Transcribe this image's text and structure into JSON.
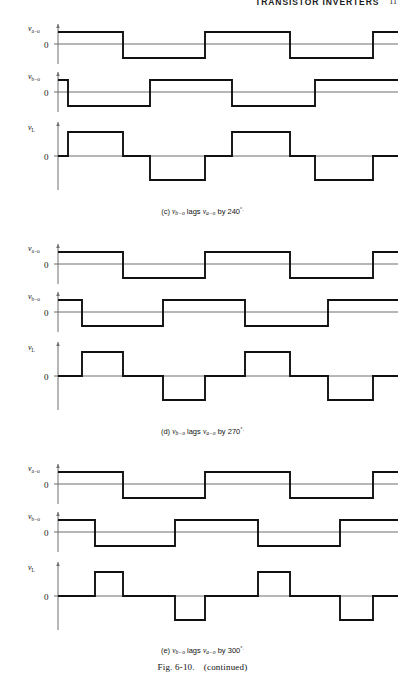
{
  "running_head": {
    "title": "TRANSISTOR INVERTERS",
    "page_number": "11"
  },
  "figure": {
    "number": "Fig. 6-10.",
    "note": "(continued)",
    "panels": [
      {
        "id": "c",
        "label": "(c)",
        "caption_lead": "(c)",
        "caption_v1": "v",
        "caption_v1_sub": "b−o",
        "caption_mid": "lags",
        "caption_v2": "v",
        "caption_v2_sub": "a−o",
        "caption_by": "by",
        "caption_angle": "240",
        "caption_deg": "°.",
        "phase_lag_degrees": 240,
        "traces": [
          {
            "name": "v_a-o",
            "label_v": "v",
            "label_sub": "a−o",
            "zero_label": "0",
            "type": "square-bipolar",
            "edges_px": [
              123,
              205,
              290,
              373
            ],
            "start_state": "high"
          },
          {
            "name": "v_b-o",
            "label_v": "v",
            "label_sub": "b−o",
            "zero_label": "0",
            "type": "square-bipolar",
            "edges_px": [
              68,
              150,
              232,
              315
            ],
            "start_state": "high"
          },
          {
            "name": "v_L",
            "label_v": "v",
            "label_sub": "L",
            "zero_label": "0",
            "type": "quasi-square",
            "pulses_px": [
              {
                "from": 68,
                "to": 123,
                "sign": 1
              },
              {
                "from": 150,
                "to": 205,
                "sign": -1
              },
              {
                "from": 232,
                "to": 290,
                "sign": 1
              },
              {
                "from": 315,
                "to": 373,
                "sign": -1
              }
            ]
          }
        ]
      },
      {
        "id": "d",
        "label": "(d)",
        "caption_lead": "(d)",
        "caption_v1": "v",
        "caption_v1_sub": "b−o",
        "caption_mid": "lags",
        "caption_v2": "v",
        "caption_v2_sub": "a−o",
        "caption_by": "by",
        "caption_angle": "270",
        "caption_deg": "°.",
        "phase_lag_degrees": 270,
        "traces": [
          {
            "name": "v_a-o",
            "label_v": "v",
            "label_sub": "a−o",
            "zero_label": "0",
            "type": "square-bipolar",
            "edges_px": [
              123,
              205,
              290,
              373
            ],
            "start_state": "high"
          },
          {
            "name": "v_b-o",
            "label_v": "v",
            "label_sub": "b−o",
            "zero_label": "0",
            "type": "square-bipolar",
            "edges_px": [
              82,
              163,
              245,
              328
            ],
            "start_state": "high"
          },
          {
            "name": "v_L",
            "label_v": "v",
            "label_sub": "L",
            "zero_label": "0",
            "type": "quasi-square",
            "pulses_px": [
              {
                "from": 82,
                "to": 123,
                "sign": 1
              },
              {
                "from": 163,
                "to": 205,
                "sign": -1
              },
              {
                "from": 245,
                "to": 290,
                "sign": 1
              },
              {
                "from": 328,
                "to": 373,
                "sign": -1
              }
            ]
          }
        ]
      },
      {
        "id": "e",
        "label": "(e)",
        "caption_lead": "(e)",
        "caption_v1": "v",
        "caption_v1_sub": "b−o",
        "caption_mid": "lags",
        "caption_v2": "v",
        "caption_v2_sub": "a−o",
        "caption_by": "by",
        "caption_angle": "300",
        "caption_deg": "°.",
        "phase_lag_degrees": 300,
        "traces": [
          {
            "name": "v_a-o",
            "label_v": "v",
            "label_sub": "a−o",
            "zero_label": "0",
            "type": "square-bipolar",
            "edges_px": [
              123,
              205,
              290,
              373
            ],
            "start_state": "high"
          },
          {
            "name": "v_b-o",
            "label_v": "v",
            "label_sub": "b−o",
            "zero_label": "0",
            "type": "square-bipolar",
            "edges_px": [
              95,
              175,
              258,
              340
            ],
            "start_state": "high"
          },
          {
            "name": "v_L",
            "label_v": "v",
            "label_sub": "L",
            "zero_label": "0",
            "type": "quasi-square",
            "pulses_px": [
              {
                "from": 95,
                "to": 123,
                "sign": 1
              },
              {
                "from": 175,
                "to": 205,
                "sign": -1
              },
              {
                "from": 258,
                "to": 290,
                "sign": 1
              },
              {
                "from": 340,
                "to": 373,
                "sign": -1
              }
            ]
          }
        ]
      }
    ]
  },
  "chart_data": {
    "type": "line",
    "xlabel": "",
    "ylabel": "",
    "charts": [
      {
        "panel": "(c)",
        "subtitle": "v(b-o) lags v(a-o) by 240°",
        "series": [
          {
            "name": "v(a-o)",
            "type": "square",
            "levels": [
              1,
              -1,
              1,
              -1,
              1
            ],
            "transitions_deg": [
              180,
              360,
              540,
              720
            ]
          },
          {
            "name": "v(b-o)",
            "type": "square",
            "levels": [
              1,
              -1,
              1,
              -1,
              1
            ],
            "transitions_deg": [
              60,
              240,
              420,
              600
            ]
          },
          {
            "name": "v(L)",
            "type": "quasi-square",
            "pulses": [
              {
                "start_deg": 60,
                "end_deg": 180,
                "level": 1
              },
              {
                "start_deg": 240,
                "end_deg": 360,
                "level": -1
              },
              {
                "start_deg": 420,
                "end_deg": 540,
                "level": 1
              },
              {
                "start_deg": 600,
                "end_deg": 720,
                "level": -1
              }
            ]
          }
        ]
      },
      {
        "panel": "(d)",
        "subtitle": "v(b-o) lags v(a-o) by 270°",
        "series": [
          {
            "name": "v(a-o)",
            "type": "square",
            "levels": [
              1,
              -1,
              1,
              -1,
              1
            ],
            "transitions_deg": [
              180,
              360,
              540,
              720
            ]
          },
          {
            "name": "v(b-o)",
            "type": "square",
            "levels": [
              1,
              -1,
              1,
              -1,
              1
            ],
            "transitions_deg": [
              90,
              270,
              450,
              630
            ]
          },
          {
            "name": "v(L)",
            "type": "quasi-square",
            "pulses": [
              {
                "start_deg": 90,
                "end_deg": 180,
                "level": 1
              },
              {
                "start_deg": 270,
                "end_deg": 360,
                "level": -1
              },
              {
                "start_deg": 450,
                "end_deg": 540,
                "level": 1
              },
              {
                "start_deg": 630,
                "end_deg": 720,
                "level": -1
              }
            ]
          }
        ]
      },
      {
        "panel": "(e)",
        "subtitle": "v(b-o) lags v(a-o) by 300°",
        "series": [
          {
            "name": "v(a-o)",
            "type": "square",
            "levels": [
              1,
              -1,
              1,
              -1,
              1
            ],
            "transitions_deg": [
              180,
              360,
              540,
              720
            ]
          },
          {
            "name": "v(b-o)",
            "type": "square",
            "levels": [
              1,
              -1,
              1,
              -1,
              1
            ],
            "transitions_deg": [
              120,
              300,
              480,
              660
            ]
          },
          {
            "name": "v(L)",
            "type": "quasi-square",
            "pulses": [
              {
                "start_deg": 120,
                "end_deg": 180,
                "level": 1
              },
              {
                "start_deg": 300,
                "end_deg": 360,
                "level": -1
              },
              {
                "start_deg": 480,
                "end_deg": 540,
                "level": 1
              },
              {
                "start_deg": 660,
                "end_deg": 720,
                "level": -1
              }
            ]
          }
        ]
      }
    ]
  },
  "colors": {
    "ink": "#111111",
    "axis": "#6f6f6f",
    "paper": "#ffffff"
  }
}
